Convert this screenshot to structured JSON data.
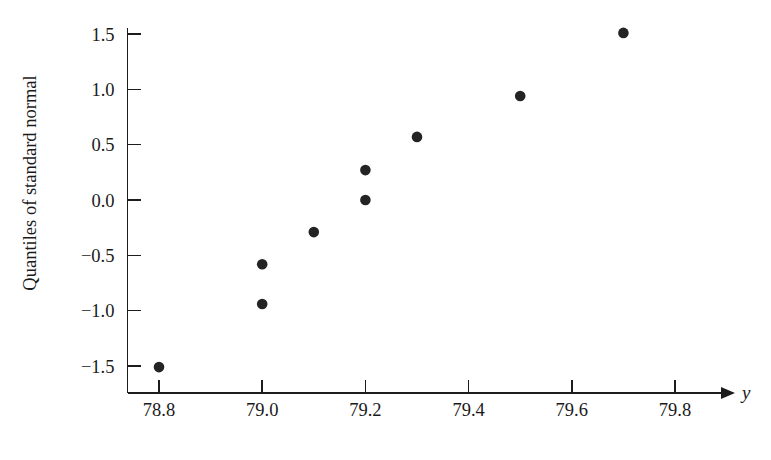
{
  "chart_data": {
    "type": "scatter",
    "title": "",
    "subtitle": "",
    "xlabel": "y",
    "ylabel": "Quantiles of standard normal",
    "xlim": [
      78.73,
      79.93
    ],
    "ylim": [
      -1.66,
      1.66
    ],
    "grid": false,
    "legend": null,
    "x_ticks": [
      "78.8",
      "79.0",
      "79.2",
      "79.4",
      "79.6",
      "79.8"
    ],
    "x_tick_values": [
      78.8,
      79.0,
      79.2,
      79.4,
      79.6,
      79.8
    ],
    "y_ticks": [
      "1.5",
      "1.0",
      "0.5",
      "0.0",
      "−0.5",
      "−1.0",
      "−1.5"
    ],
    "y_tick_values": [
      1.5,
      1.0,
      0.5,
      0.0,
      -0.5,
      -1.0,
      -1.5
    ],
    "x_axis_has_arrow": true,
    "marker": "filled-circle",
    "marker_color": "#242424",
    "axis_color": "#1c1c1c",
    "background_color": "#ffffff",
    "points": [
      {
        "x": 78.8,
        "y": -1.51
      },
      {
        "x": 79.0,
        "y": -0.94
      },
      {
        "x": 79.0,
        "y": -0.58
      },
      {
        "x": 79.1,
        "y": -0.29
      },
      {
        "x": 79.2,
        "y": 0.0
      },
      {
        "x": 79.2,
        "y": 0.27
      },
      {
        "x": 79.3,
        "y": 0.57
      },
      {
        "x": 79.5,
        "y": 0.94
      },
      {
        "x": 79.7,
        "y": 1.51
      }
    ]
  }
}
